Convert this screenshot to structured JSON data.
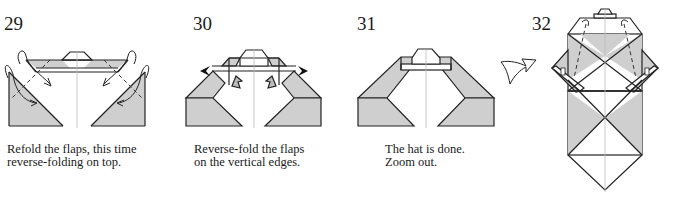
{
  "steps": [
    {
      "number": "29",
      "caption": "Refold the flaps, this time\nreverse-folding on top."
    },
    {
      "number": "30",
      "caption": "Reverse-fold the flaps\non the vertical edges."
    },
    {
      "number": "31",
      "caption": "The hat is done.\nZoom out."
    },
    {
      "number": "32",
      "caption": ""
    }
  ],
  "icons": {
    "zoom_out_arrow": "zoom-out-arrow-icon"
  },
  "colors": {
    "paper_shade": "#cfcfcf",
    "line": "#222222",
    "background": "#ffffff"
  }
}
